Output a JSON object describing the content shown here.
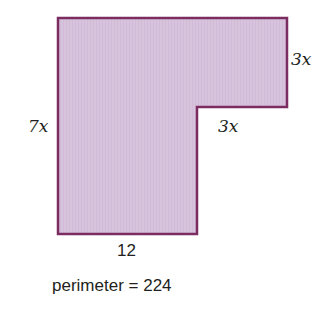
{
  "diagram": {
    "type": "L-shaped polygon",
    "fill_color": "#d8c3dd",
    "stroke_color": "#7b2d62",
    "vertices": [
      [
        58,
        18
      ],
      [
        287,
        18
      ],
      [
        287,
        107
      ],
      [
        197,
        107
      ],
      [
        197,
        234
      ],
      [
        58,
        234
      ]
    ],
    "labels": {
      "left_side": "7x",
      "top_right_side": "3x",
      "inner_step": "3x",
      "bottom_side": "12"
    },
    "caption": "perimeter = 224"
  }
}
